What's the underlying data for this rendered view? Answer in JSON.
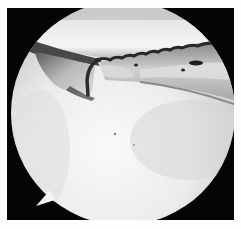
{
  "image": {
    "kind": "arthroscopic-view",
    "description": "Circular endoscopic view of a joint with a curved suture-passing instrument over tissue",
    "colors": {
      "background": "#fdfdfd",
      "frame": "#050505",
      "bright_tissue": "#f2f2f2",
      "mid_tissue": "#9a9a9a",
      "dark_tissue": "#3a3a3a"
    }
  }
}
